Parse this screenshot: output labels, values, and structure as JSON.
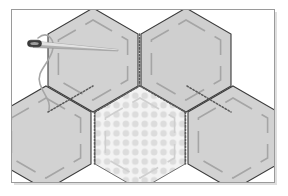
{
  "illustration": {
    "title": "English paper piecing hexagon quilt patches with needle and thread",
    "subject": "hexagon-patchwork",
    "canvas": {
      "width": 288,
      "height": 196
    },
    "frame": {
      "name": "image-frame",
      "x": 11.5,
      "y": 9.5,
      "width": 263,
      "height": 173,
      "stroke": "#9a9a9a",
      "stroke_width": 1,
      "fill": "#ffffff",
      "shadow": "#d8d8d8"
    },
    "palette": {
      "background": "#ffffff",
      "patch_fill": "#d2d2d2",
      "patch_fill_alt": "#cccccc",
      "patch_outline": "#3b3b3b",
      "stitch_dash": "#a0a0a0",
      "seam_stitch": "#555555",
      "dotted_patch_fill": "#f2f2f2",
      "dot_color": "#d8d8d8",
      "needle_body": "#b9b9b9",
      "needle_eye": "#3c3c3c",
      "thread": "#a6a6a6"
    },
    "hexagons": [
      {
        "name": "hexagon-top-left",
        "cx": 93,
        "cy": 60,
        "r": 52,
        "fill": "#d2d2d2",
        "pattern": "plain"
      },
      {
        "name": "hexagon-top-right",
        "cx": 186,
        "cy": 60,
        "r": 52,
        "fill": "#d2d2d2",
        "pattern": "plain"
      },
      {
        "name": "hexagon-bottom-left",
        "cx": 46,
        "cy": 138,
        "r": 52,
        "fill": "#d2d2d2",
        "pattern": "plain"
      },
      {
        "name": "hexagon-bottom-center",
        "cx": 140,
        "cy": 138,
        "r": 52,
        "fill": "#f2f2f2",
        "pattern": "polka-dots"
      },
      {
        "name": "hexagon-bottom-right",
        "cx": 233,
        "cy": 138,
        "r": 52,
        "fill": "#d2d2d2",
        "pattern": "plain"
      }
    ],
    "needle": {
      "name": "sewing-needle",
      "tip_x": 118,
      "tip_y": 50,
      "eye_x": 31,
      "eye_y": 44,
      "length": 88,
      "eye_length": 13
    },
    "thread": {
      "name": "thread-strand",
      "path": "M 38 38 C 48 30 56 40 52 52 C 47 66 36 72 40 84 C 44 96 51 100 49 110"
    },
    "counts": {
      "hexagon_count": 5,
      "plain_patches": 4,
      "patterned_patches": 1
    }
  }
}
